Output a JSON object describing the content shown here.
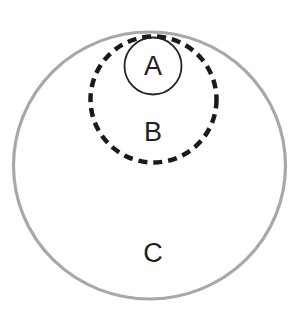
{
  "diagram": {
    "type": "nested-circles",
    "caption_top": "",
    "colors": {
      "outer_stroke": "#a8a8a8",
      "dashed_stroke": "#1a1a1a",
      "inner_stroke": "#222222",
      "label": "#222222",
      "background": "#ffffff"
    },
    "circles": [
      {
        "id": "C",
        "label": "C",
        "style": "solid-gray",
        "contains": [
          "B"
        ]
      },
      {
        "id": "B",
        "label": "B",
        "style": "dashed-black",
        "contains": [
          "A"
        ]
      },
      {
        "id": "A",
        "label": "A",
        "style": "solid-thin-black",
        "contains": []
      }
    ]
  }
}
